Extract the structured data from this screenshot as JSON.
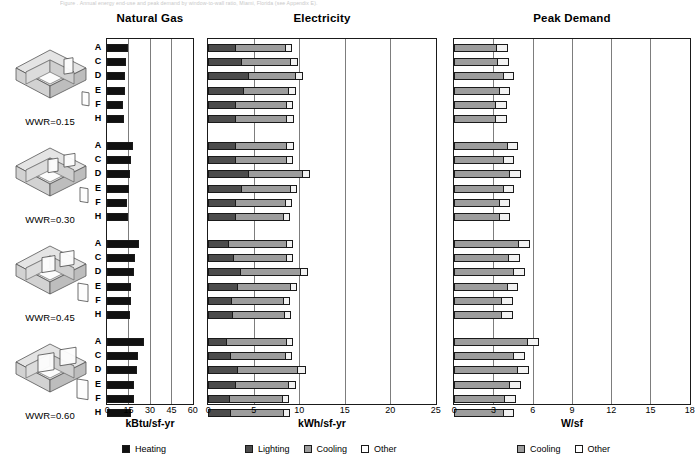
{
  "caption": "Figure  . Annual energy end-use and peak demand by window-to-wall ratio, Miami, Florida (see Appendix E).",
  "panels": {
    "gas": {
      "title": "Natural Gas",
      "axis_label": "kBtu/sf-yr",
      "ticks": [
        0,
        15,
        30,
        45,
        60
      ],
      "max": 60
    },
    "elec": {
      "title": "Electricity",
      "axis_label": "kWh/sf-yr",
      "ticks": [
        0,
        5,
        10,
        15,
        20,
        25
      ],
      "max": 25
    },
    "peak": {
      "title": "Peak Demand",
      "axis_label": "W/sf",
      "ticks": [
        0,
        3,
        6,
        9,
        12,
        15,
        18
      ],
      "max": 18
    }
  },
  "legends": {
    "gas": [
      {
        "label": "Heating",
        "swatch": "sw-heating"
      }
    ],
    "elec": [
      {
        "label": "Lighting",
        "swatch": "sw-lighting"
      },
      {
        "label": "Cooling",
        "swatch": "sw-cooling"
      },
      {
        "label": "Other",
        "swatch": "sw-other"
      }
    ],
    "peak": [
      {
        "label": "Cooling",
        "swatch": "sw-cooling"
      },
      {
        "label": "Other",
        "swatch": "sw-other"
      }
    ]
  },
  "row_labels": [
    "A",
    "C",
    "D",
    "E",
    "F",
    "H"
  ],
  "groups": [
    {
      "wwr_label": "WWR=0.15"
    },
    {
      "wwr_label": "WWR=0.30"
    },
    {
      "wwr_label": "WWR=0.45"
    },
    {
      "wwr_label": "WWR=0.60"
    }
  ],
  "colors": {
    "heating": "#111111",
    "lighting": "#4c4c4c",
    "cooling": "#9d9d9d",
    "other": "#f2f2f2",
    "frame": "#1a1a1a",
    "grid": "#7d7d7d"
  },
  "chart_data": {
    "type": "bar",
    "title": "Annual energy end-use and peak demand by window-to-wall ratio",
    "orientation": "horizontal",
    "stacked": true,
    "groups": [
      "WWR=0.15",
      "WWR=0.30",
      "WWR=0.45",
      "WWR=0.60"
    ],
    "categories": [
      "A",
      "C",
      "D",
      "E",
      "F",
      "H"
    ],
    "subplots": [
      {
        "name": "Natural Gas",
        "xlabel": "kBtu/sf-yr",
        "xlim": [
          0,
          60
        ],
        "xticks": [
          0,
          15,
          30,
          45,
          60
        ],
        "grid": true,
        "series": [
          {
            "name": "Heating"
          }
        ],
        "values": {
          "WWR=0.15": {
            "Heating": [
              14.5,
              13.0,
              12.5,
              12.5,
              11.0,
              12.0
            ]
          },
          "WWR=0.30": {
            "Heating": [
              18.0,
              16.5,
              16.0,
              15.0,
              14.0,
              14.5
            ]
          },
          "WWR=0.45": {
            "Heating": [
              22.0,
              19.5,
              19.0,
              17.0,
              16.5,
              16.0
            ]
          },
          "WWR=0.60": {
            "Heating": [
              25.5,
              21.5,
              21.0,
              19.0,
              18.5,
              17.0
            ]
          }
        }
      },
      {
        "name": "Electricity",
        "xlabel": "kWh/sf-yr",
        "xlim": [
          0,
          25
        ],
        "xticks": [
          0,
          5,
          10,
          15,
          20,
          25
        ],
        "grid": true,
        "series": [
          {
            "name": "Lighting"
          },
          {
            "name": "Cooling"
          },
          {
            "name": "Other"
          }
        ],
        "values": {
          "WWR=0.15": {
            "Lighting": [
              3.0,
              3.6,
              4.4,
              3.8,
              3.0,
              3.0
            ],
            "Cooling": [
              5.4,
              5.4,
              5.1,
              5.0,
              5.6,
              5.6
            ],
            "Other": [
              0.8,
              0.9,
              0.9,
              0.8,
              0.7,
              0.8
            ]
          },
          "WWR=0.30": {
            "Lighting": [
              2.9,
              2.9,
              4.4,
              3.6,
              2.9,
              2.9
            ],
            "Cooling": [
              5.7,
              5.6,
              5.9,
              5.4,
              5.5,
              5.3
            ],
            "Other": [
              0.8,
              0.8,
              0.9,
              0.8,
              0.8,
              0.8
            ]
          },
          "WWR=0.45": {
            "Lighting": [
              2.2,
              2.7,
              3.5,
              3.2,
              2.5,
              2.6
            ],
            "Cooling": [
              6.3,
              5.8,
              6.6,
              5.8,
              5.7,
              5.7
            ],
            "Other": [
              0.8,
              0.8,
              0.9,
              0.8,
              0.8,
              0.8
            ]
          },
          "WWR=0.60": {
            "Lighting": [
              2.0,
              2.4,
              3.2,
              2.9,
              2.3,
              2.4
            ],
            "Cooling": [
              6.5,
              6.0,
              6.6,
              5.9,
              5.8,
              5.8
            ],
            "Other": [
              0.8,
              0.8,
              0.9,
              0.8,
              0.8,
              0.8
            ]
          }
        }
      },
      {
        "name": "Peak Demand",
        "xlabel": "W/sf",
        "xlim": [
          0,
          18
        ],
        "xticks": [
          0,
          3,
          6,
          9,
          12,
          15,
          18
        ],
        "grid": true,
        "series": [
          {
            "name": "Cooling"
          },
          {
            "name": "Other"
          }
        ],
        "values": {
          "WWR=0.15": {
            "Cooling": [
              3.2,
              3.3,
              3.7,
              3.4,
              3.1,
              3.1
            ],
            "Other": [
              0.9,
              0.9,
              0.9,
              0.9,
              0.9,
              0.9
            ]
          },
          "WWR=0.30": {
            "Cooling": [
              4.0,
              3.7,
              4.2,
              3.7,
              3.4,
              3.4
            ],
            "Other": [
              0.9,
              0.9,
              0.9,
              0.9,
              0.9,
              0.9
            ]
          },
          "WWR=0.45": {
            "Cooling": [
              4.9,
              4.1,
              4.5,
              4.0,
              3.6,
              3.6
            ],
            "Other": [
              0.9,
              0.9,
              0.9,
              0.9,
              0.9,
              0.9
            ]
          },
          "WWR=0.60": {
            "Cooling": [
              5.6,
              4.5,
              4.8,
              4.2,
              3.8,
              3.7
            ],
            "Other": [
              0.9,
              0.9,
              0.9,
              0.9,
              0.9,
              0.9
            ]
          }
        }
      }
    ]
  }
}
